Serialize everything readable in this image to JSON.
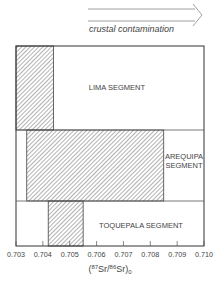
{
  "chart_data": {
    "type": "range-bar",
    "title": "",
    "annotation": {
      "arrow_label": "crustal contamination",
      "arrow_direction": "right"
    },
    "xlabel": "(87Sr/86Sr)0",
    "xlabel_parts": {
      "open": "(",
      "sup1": "87",
      "mid": "Sr/",
      "sup2": "86",
      "end": "Sr)",
      "sub": "0"
    },
    "xlim": [
      0.703,
      0.71
    ],
    "xticks": [
      0.703,
      0.704,
      0.705,
      0.706,
      0.707,
      0.708,
      0.709,
      0.71
    ],
    "xtick_labels": [
      "0.703",
      "0.704",
      "0.705",
      "0.706",
      "0.707",
      "0.708",
      "0.709",
      "0.710"
    ],
    "categories": [
      "LIMA SEGMENT",
      "AREQUIPA SEGMENT",
      "TOQUEPALA SEGMENT"
    ],
    "series": [
      {
        "name": "LIMA SEGMENT",
        "label_lines": [
          "LIMA SEGMENT"
        ],
        "min": 0.703,
        "max": 0.7044
      },
      {
        "name": "AREQUIPA SEGMENT",
        "label_lines": [
          "AREQUIPA",
          "SEGMENT"
        ],
        "min": 0.7034,
        "max": 0.7085
      },
      {
        "name": "TOQUEPALA SEGMENT",
        "label_lines": [
          "TOQUEPALA SEGMENT"
        ],
        "min": 0.7042,
        "max": 0.7055
      }
    ],
    "fill_pattern": "diagonal-hatch",
    "grid": false
  }
}
